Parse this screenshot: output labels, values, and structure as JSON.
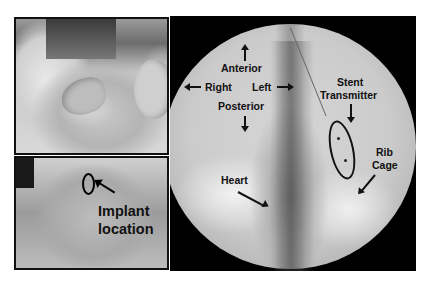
{
  "figure": {
    "panels": [
      {
        "id": "pig-top",
        "description": "photo of pig head, side view"
      },
      {
        "id": "pig-bottom",
        "description": "photo of pig ventral neck with implant location marked"
      },
      {
        "id": "xray",
        "description": "fluoroscopy image of chest with stent transmitter"
      }
    ],
    "pig_bottom": {
      "label_line1": "Implant",
      "label_line2": "location"
    },
    "xray": {
      "labels": {
        "anterior": "Anterior",
        "right": "Right",
        "left": "Left",
        "posterior": "Posterior",
        "stent_line1": "Stent",
        "stent_line2": "Transmitter",
        "rib_line1": "Rib",
        "rib_line2": "Cage",
        "heart": "Heart"
      }
    },
    "colors": {
      "background": "#ffffff",
      "border": "#111111",
      "xray_background": "#000000",
      "label": "#111111"
    }
  }
}
